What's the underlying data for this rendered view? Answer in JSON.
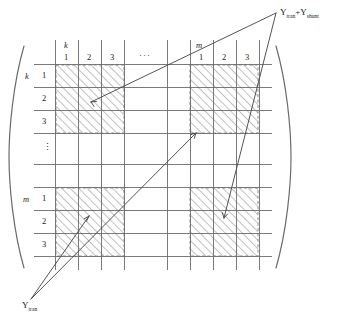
{
  "figure": {
    "type": "block-matrix-diagram",
    "matrix": {
      "bracket_left": "(",
      "bracket_right": ")",
      "column_groups": [
        {
          "label": "k",
          "columns": [
            "1",
            "2",
            "3"
          ]
        },
        {
          "label": "",
          "columns": [
            "···"
          ],
          "is_ellipsis": true
        },
        {
          "label": "m",
          "columns": [
            "1",
            "2",
            "3"
          ]
        }
      ],
      "row_groups": [
        {
          "label": "k",
          "rows": [
            "1",
            "2",
            "3"
          ]
        },
        {
          "label": "",
          "rows": [
            "⋮"
          ],
          "is_ellipsis": true
        },
        {
          "label": "m",
          "rows": [
            "1",
            "2",
            "3"
          ]
        }
      ],
      "hatched_blocks": [
        {
          "row_group": "k",
          "col_group": "k"
        },
        {
          "row_group": "k",
          "col_group": "m"
        },
        {
          "row_group": "m",
          "col_group": "k"
        },
        {
          "row_group": "m",
          "col_group": "m"
        }
      ],
      "hatch_angle_deg": 45,
      "block_border_style": "dashed"
    },
    "annotations": [
      {
        "id": "y-trans",
        "text_parts": [
          {
            "base": "Y",
            "sub": "tran"
          }
        ],
        "plain": "Y_tran",
        "position": "bottom-left",
        "targets": [
          "block-m-k",
          "block-k-m"
        ],
        "arrow_count": 2
      },
      {
        "id": "y-trans-plus-y-shunt",
        "text_parts": [
          {
            "base": "Y",
            "sub": "tran"
          },
          {
            "op": "+"
          },
          {
            "base": "Y",
            "sub": "shunt"
          }
        ],
        "plain": "Y_tran + Y_shunt",
        "position": "top-right",
        "targets": [
          "block-k-k",
          "block-m-m"
        ],
        "arrow_count": 2
      }
    ],
    "colors": {
      "grid_line": "#6b6b6b",
      "hatch_line": "#9a9a9a",
      "block_border": "#8f8f8f",
      "arrow": "#4a4a4a",
      "bracket": "#6b6b6b",
      "text": "#1a1a1a",
      "background": "#ffffff"
    }
  }
}
